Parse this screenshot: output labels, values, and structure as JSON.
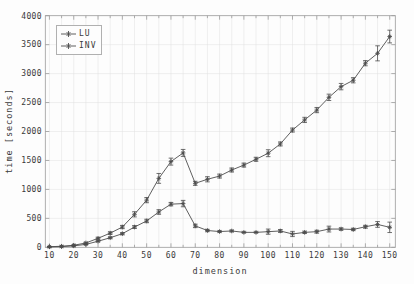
{
  "chart_data": {
    "type": "line",
    "title": "",
    "xlabel": "dimension",
    "ylabel": "time [seconds]",
    "grid": true,
    "legend_position": "top-left",
    "marker": "asterisk-with-errorbars",
    "xlim": [
      8.3,
      152.3
    ],
    "ylim": [
      0,
      4000
    ],
    "xticks": [
      10,
      20,
      30,
      40,
      50,
      60,
      70,
      80,
      90,
      100,
      110,
      120,
      130,
      140,
      150
    ],
    "xtick_minor_step": 5,
    "yticks": [
      0,
      500,
      1000,
      1500,
      2000,
      2500,
      3000,
      3500,
      4000
    ],
    "x": [
      10,
      15,
      20,
      25,
      30,
      35,
      40,
      45,
      50,
      55,
      60,
      65,
      70,
      75,
      80,
      85,
      90,
      95,
      100,
      105,
      110,
      115,
      120,
      125,
      130,
      135,
      140,
      145,
      150
    ],
    "series": [
      {
        "name": "LU",
        "values": [
          8,
          12,
          25,
          50,
          105,
          165,
          235,
          350,
          455,
          610,
          745,
          755,
          370,
          290,
          272,
          282,
          258,
          258,
          270,
          282,
          230,
          258,
          270,
          315,
          315,
          308,
          355,
          395,
          345
        ],
        "errors": [
          3,
          3,
          5,
          8,
          12,
          15,
          18,
          25,
          30,
          40,
          30,
          55,
          30,
          20,
          15,
          15,
          10,
          10,
          45,
          25,
          45,
          20,
          25,
          50,
          20,
          20,
          25,
          50,
          90
        ]
      },
      {
        "name": "INV",
        "values": [
          10,
          18,
          35,
          75,
          155,
          245,
          350,
          570,
          815,
          1190,
          1480,
          1630,
          1105,
          1175,
          1230,
          1335,
          1420,
          1520,
          1625,
          1785,
          2025,
          2200,
          2370,
          2590,
          2775,
          2885,
          3180,
          3350,
          3640
        ],
        "errors": [
          4,
          5,
          8,
          12,
          18,
          22,
          28,
          45,
          45,
          85,
          60,
          60,
          35,
          45,
          35,
          35,
          35,
          35,
          60,
          35,
          35,
          45,
          45,
          55,
          55,
          45,
          45,
          130,
          110
        ]
      }
    ],
    "colors": {
      "line": "#4d4d4d",
      "grid": "#e0e0e0",
      "axis": "#9a9a9a",
      "text": "#3a3a3a",
      "background": "#fdfdfd"
    }
  }
}
